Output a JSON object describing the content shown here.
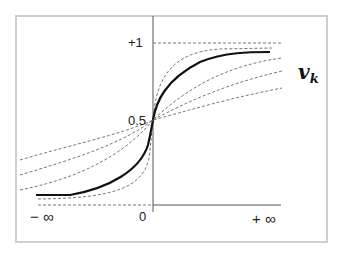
{
  "diagram": {
    "output_label": "v",
    "output_subscript": "k",
    "y_labels": {
      "top": "+1",
      "mid": "0.5",
      "origin": "0"
    },
    "x_labels": {
      "left": "− ∞",
      "right": "+ ∞"
    },
    "curves": [
      {
        "name": "bold-sigmoid",
        "style": "solid",
        "color": "#111111"
      },
      {
        "name": "steep-sigmoid",
        "style": "dashed",
        "color": "#666666"
      },
      {
        "name": "shallow-sigmoid-1",
        "style": "dashed",
        "color": "#666666"
      },
      {
        "name": "shallow-sigmoid-2",
        "style": "dashed",
        "color": "#666666"
      },
      {
        "name": "shallow-sigmoid-3",
        "style": "dashed",
        "color": "#666666"
      }
    ],
    "colors": {
      "frame": "#cfcfcf",
      "axis": "#555555",
      "dashed": "#777777",
      "bold": "#111111"
    }
  }
}
